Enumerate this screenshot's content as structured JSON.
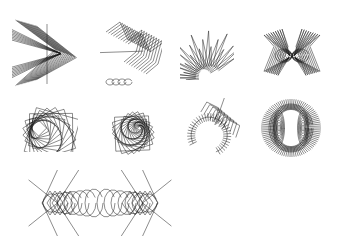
{
  "canvas": {
    "width": 339,
    "height": 246,
    "background": "#ffffff",
    "stroke": "#1a1a1a"
  },
  "figures": [
    {
      "id": "chevron-fan",
      "x": 12,
      "y": 12,
      "w": 70,
      "h": 80
    },
    {
      "id": "zigzag-curl",
      "x": 100,
      "y": 18,
      "w": 62,
      "h": 72
    },
    {
      "id": "fan-arc",
      "x": 180,
      "y": 24,
      "w": 54,
      "h": 56
    },
    {
      "id": "butterfly",
      "x": 262,
      "y": 22,
      "w": 60,
      "h": 58
    },
    {
      "id": "square-spiral-small",
      "x": 20,
      "y": 106,
      "w": 58,
      "h": 46
    },
    {
      "id": "square-spiral",
      "x": 112,
      "y": 104,
      "w": 50,
      "h": 54
    },
    {
      "id": "hook-spiral",
      "x": 184,
      "y": 98,
      "w": 56,
      "h": 60
    },
    {
      "id": "dense-ring",
      "x": 258,
      "y": 98,
      "w": 66,
      "h": 60
    },
    {
      "id": "symmetric-knot",
      "x": 24,
      "y": 170,
      "w": 152,
      "h": 66
    }
  ]
}
